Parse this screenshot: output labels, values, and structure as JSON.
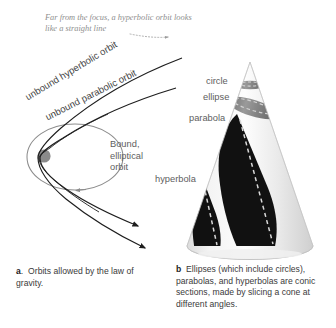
{
  "figure": {
    "panel_a": {
      "annotation": "Far from the focus, a hyperbolic orbit looks like a straight line",
      "curve_labels": {
        "hyperbolic": "unbound hyperbolic orbit",
        "parabolic": "unbound parabolic orbit"
      },
      "bound_label_line1": "Bound,",
      "bound_label_line2": "elliptical",
      "bound_label_line3": "orbit",
      "caption_lead": "a",
      "caption_text": "Orbits allowed by the law of gravity."
    },
    "panel_b": {
      "cone_labels": {
        "circle": "circle",
        "ellipse": "ellipse",
        "parabola": "parabola",
        "hyperbola": "hyperbola"
      },
      "caption_lead": "b",
      "caption_text": "Ellipses (which include circles), parabolas, and hyperbolas are conic sections, made by slicing a cone at different angles."
    },
    "colors": {
      "background": "#ffffff",
      "curve_dark": "#1e1e1e",
      "curve_gray": "#8c8c8c",
      "focus_dot": "#8a8a8a",
      "annotation_text": "#8e8e8e",
      "label_text": "#5e5e5e",
      "caption_text": "#3a3a3a",
      "cone_body_light": "#f2f2f2",
      "cone_body_mid": "#e2e2e2",
      "cone_section_dark": "#111111",
      "cone_band_gray": "#808080"
    }
  }
}
